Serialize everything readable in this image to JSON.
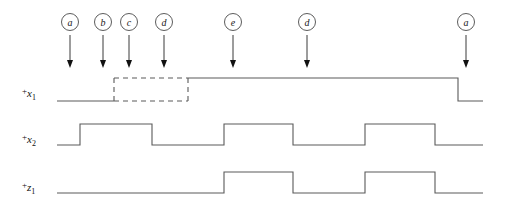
{
  "figure": {
    "type": "timing-diagram",
    "width": 507,
    "height": 214,
    "background_color": "#ffffff",
    "line_color": "#5a5a5a",
    "arrow_color": "#111111",
    "text_color": "#111111"
  },
  "markers": [
    {
      "label": "a",
      "x": 70,
      "arrow_top": 35,
      "arrow_bottom": 68
    },
    {
      "label": "b",
      "x": 103,
      "arrow_top": 35,
      "arrow_bottom": 68
    },
    {
      "label": "c",
      "x": 129,
      "arrow_top": 35,
      "arrow_bottom": 68
    },
    {
      "label": "d",
      "x": 164,
      "arrow_top": 35,
      "arrow_bottom": 68
    },
    {
      "label": "e",
      "x": 233,
      "arrow_top": 35,
      "arrow_bottom": 68
    },
    {
      "label": "d",
      "x": 307,
      "arrow_top": 35,
      "arrow_bottom": 68
    },
    {
      "label": "a",
      "x": 466,
      "arrow_top": 35,
      "arrow_bottom": 68
    }
  ],
  "marker_circle": {
    "cy": 22,
    "r": 8.5
  },
  "signals": [
    {
      "name": "+x1",
      "label_plus": "+",
      "label_base": "x",
      "label_sub": "1",
      "label_x": 22,
      "label_y": 97,
      "y_high": 78,
      "y_low": 101,
      "x_start": 57,
      "x_end": 483,
      "solid_path": "M 57 101 L 114 101 M 188 78 L 458 78 L 458 101 L 483 101",
      "dashed_path": "M 114 78 L 188 78 M 114 101 L 188 101 M 114 78 L 114 101 M 188 78 L 188 101",
      "has_dashed_box": true,
      "dashed_box": {
        "x1": 114,
        "x2": 188,
        "y_top": 78,
        "y_bottom": 101
      },
      "transitions": [
        {
          "x": 188,
          "edge": "rise"
        },
        {
          "x": 458,
          "edge": "fall"
        }
      ]
    },
    {
      "name": "+x2",
      "label_plus": "+",
      "label_base": "x",
      "label_sub": "2",
      "label_x": 22,
      "label_y": 143,
      "y_high": 124,
      "y_low": 145,
      "x_start": 57,
      "x_end": 483,
      "solid_path": "M 57 145 L 80 145 L 80 124 L 152 124 L 152 145 L 224 145 L 224 124 L 293 124 L 293 145 L 365 145 L 365 124 L 435 124 L 435 145 L 483 145",
      "dashed_path": "",
      "has_dashed_box": false,
      "transitions": [
        {
          "x": 80,
          "edge": "rise"
        },
        {
          "x": 152,
          "edge": "fall"
        },
        {
          "x": 224,
          "edge": "rise"
        },
        {
          "x": 293,
          "edge": "fall"
        },
        {
          "x": 365,
          "edge": "rise"
        },
        {
          "x": 435,
          "edge": "fall"
        }
      ]
    },
    {
      "name": "+z1",
      "label_plus": "+",
      "label_base": "z",
      "label_sub": "1",
      "label_x": 22,
      "label_y": 191,
      "y_high": 172,
      "y_low": 193,
      "x_start": 57,
      "x_end": 483,
      "solid_path": "M 57 193 L 224 193 L 224 172 L 293 172 L 293 193 L 365 193 L 365 172 L 435 172 L 435 193 L 483 193",
      "dashed_path": "",
      "has_dashed_box": false,
      "transitions": [
        {
          "x": 224,
          "edge": "rise"
        },
        {
          "x": 293,
          "edge": "fall"
        },
        {
          "x": 365,
          "edge": "rise"
        },
        {
          "x": 435,
          "edge": "fall"
        }
      ]
    }
  ],
  "chart_data": {
    "type": "line",
    "title": "",
    "xlabel": "",
    "ylabel": "",
    "series": [
      {
        "name": "+x1",
        "levels": [
          {
            "from_x": 57,
            "to_x": 114,
            "level": "low"
          },
          {
            "from_x": 114,
            "to_x": 188,
            "level": "dont-care"
          },
          {
            "from_x": 188,
            "to_x": 458,
            "level": "high"
          },
          {
            "from_x": 458,
            "to_x": 483,
            "level": "low"
          }
        ]
      },
      {
        "name": "+x2",
        "levels": [
          {
            "from_x": 57,
            "to_x": 80,
            "level": "low"
          },
          {
            "from_x": 80,
            "to_x": 152,
            "level": "high"
          },
          {
            "from_x": 152,
            "to_x": 224,
            "level": "low"
          },
          {
            "from_x": 224,
            "to_x": 293,
            "level": "high"
          },
          {
            "from_x": 293,
            "to_x": 365,
            "level": "low"
          },
          {
            "from_x": 365,
            "to_x": 435,
            "level": "high"
          },
          {
            "from_x": 435,
            "to_x": 483,
            "level": "low"
          }
        ]
      },
      {
        "name": "+z1",
        "levels": [
          {
            "from_x": 57,
            "to_x": 224,
            "level": "low"
          },
          {
            "from_x": 224,
            "to_x": 293,
            "level": "high"
          },
          {
            "from_x": 293,
            "to_x": 365,
            "level": "low"
          },
          {
            "from_x": 365,
            "to_x": 435,
            "level": "high"
          },
          {
            "from_x": 435,
            "to_x": 483,
            "level": "low"
          }
        ]
      }
    ],
    "annotations": [
      {
        "label": "a",
        "x": 70
      },
      {
        "label": "b",
        "x": 103
      },
      {
        "label": "c",
        "x": 129
      },
      {
        "label": "d",
        "x": 164
      },
      {
        "label": "e",
        "x": 233
      },
      {
        "label": "d",
        "x": 307
      },
      {
        "label": "a",
        "x": 466
      }
    ]
  }
}
